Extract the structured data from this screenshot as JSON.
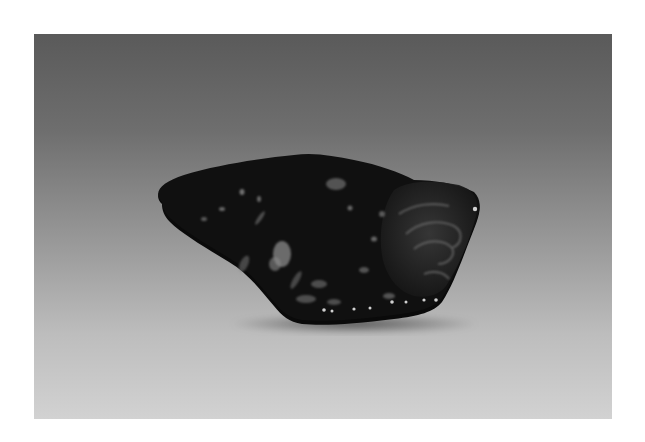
{
  "photo": {
    "subject": "dark polished stone specimen",
    "background": "gray studio gradient",
    "colors": {
      "frame": "#ffffff",
      "backdrop_top": "#5a5a5a",
      "backdrop_bottom": "#d2d2d2",
      "stone_body": "#0d0d0d",
      "stone_fleck": "#8a8a8a"
    }
  }
}
